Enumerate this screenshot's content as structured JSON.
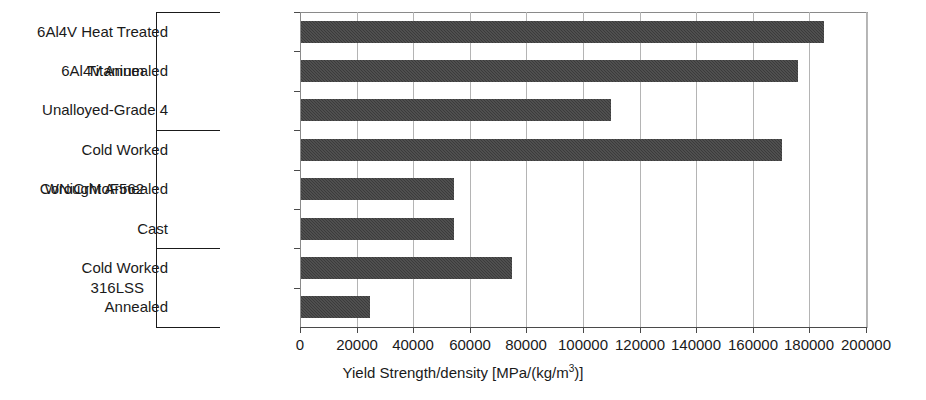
{
  "chart_data": {
    "type": "bar",
    "orientation": "horizontal",
    "title": "",
    "xlabel": "Yield Strength/density [MPa/(kg/m3)]",
    "xlabel_parts": {
      "main": "Yield Strength/density [MPa/(kg/m",
      "superscript": "3",
      "tail": ")]"
    },
    "ylabel": "",
    "xlim": [
      0,
      200000
    ],
    "xticks": [
      0,
      20000,
      40000,
      60000,
      80000,
      100000,
      120000,
      140000,
      160000,
      180000,
      200000
    ],
    "xtick_labels": [
      "0",
      "20000",
      "40000",
      "60000",
      "80000",
      "100000",
      "120000",
      "140000",
      "160000",
      "180000",
      "200000"
    ],
    "grid": true,
    "grid_axis": "x",
    "legend": false,
    "bar_color": "#3b3b3b",
    "categories": [
      "6Al4V Heat Treated",
      "6Al4V Annealed",
      "Unalloyed-Grade 4",
      "Cold Worked",
      "Wrought Annealed",
      "Cast",
      "Cold Worked",
      "Annealed"
    ],
    "values": [
      184800,
      175600,
      109500,
      169800,
      54000,
      54000,
      74500,
      24500
    ],
    "groups": [
      {
        "label": "Titanium",
        "start_index": 0,
        "end_index": 2
      },
      {
        "label": "CoNiCrMoF562",
        "start_index": 3,
        "end_index": 5
      },
      {
        "label": "316LSS",
        "start_index": 6,
        "end_index": 7
      }
    ]
  }
}
